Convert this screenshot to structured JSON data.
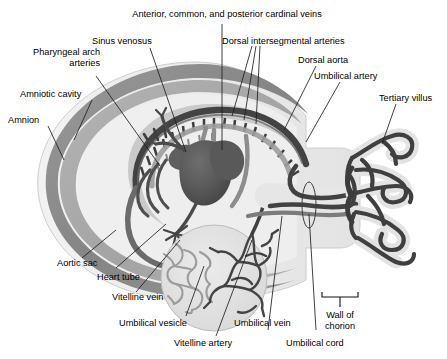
{
  "figure": {
    "background_color": "#ffffff",
    "width": 447,
    "height": 359
  },
  "palette": {
    "amnion_outer": "#8a8a8a",
    "amniotic_cavity": "#a9a9a9",
    "chorion_light": "#ececec",
    "vessel_dark": "#4c4c4c",
    "vessel_mid": "#6f6f6f",
    "vessel_light": "#9a9a9a",
    "heart_tube": "#5a5a5a",
    "villus_fill": "#e2e2e2",
    "label_text": "#000000",
    "leader_line": "#2b2b2b"
  },
  "labels": [
    {
      "id": "anterior-common-posterior-cardinal-veins",
      "text": "Anterior, common, and posterior cardinal veins"
    },
    {
      "id": "sinus-venosus",
      "text": "Sinus venosus"
    },
    {
      "id": "dorsal-intersegmental-arteries",
      "text": "Dorsal intersegmental arteries"
    },
    {
      "id": "dorsal-aorta",
      "text": "Dorsal aorta"
    },
    {
      "id": "pharyngeal-arch-arteries",
      "text": "Pharyngeal arch\narteries"
    },
    {
      "id": "amniotic-cavity",
      "text": "Amniotic cavity"
    },
    {
      "id": "amnion",
      "text": "Amnion"
    },
    {
      "id": "umbilical-artery",
      "text": "Umbilical artery"
    },
    {
      "id": "tertiary-villus",
      "text": "Tertiary villus"
    },
    {
      "id": "aortic-sac",
      "text": "Aortic sac"
    },
    {
      "id": "heart-tube",
      "text": "Heart tube"
    },
    {
      "id": "vitelline-vein",
      "text": "Vitelline vein"
    },
    {
      "id": "umbilical-vesicle",
      "text": "Umbilical vesicle"
    },
    {
      "id": "vitelline-artery",
      "text": "Vitelline artery"
    },
    {
      "id": "umbilical-vein",
      "text": "Umbilical vein"
    },
    {
      "id": "umbilical-cord",
      "text": "Umbilical cord"
    },
    {
      "id": "wall-of-chorion",
      "text": "Wall of\nchorion"
    }
  ],
  "label_text": {
    "anterior_common_posterior_cardinal_veins": "Anterior, common, and posterior cardinal veins",
    "sinus_venosus": "Sinus venosus",
    "dorsal_intersegmental_arteries": "Dorsal intersegmental arteries",
    "dorsal_aorta": "Dorsal aorta",
    "pharyngeal_arch_arteries_line1": "Pharyngeal arch",
    "pharyngeal_arch_arteries_line2": "arteries",
    "amniotic_cavity": "Amniotic cavity",
    "amnion": "Amnion",
    "umbilical_artery": "Umbilical artery",
    "tertiary_villus": "Tertiary villus",
    "aortic_sac": "Aortic sac",
    "heart_tube": "Heart tube",
    "vitelline_vein": "Vitelline vein",
    "umbilical_vesicle": "Umbilical vesicle",
    "vitelline_artery": "Vitelline artery",
    "umbilical_vein": "Umbilical vein",
    "umbilical_cord": "Umbilical cord",
    "wall_of_chorion_line1": "Wall of",
    "wall_of_chorion_line2": "chorion"
  }
}
